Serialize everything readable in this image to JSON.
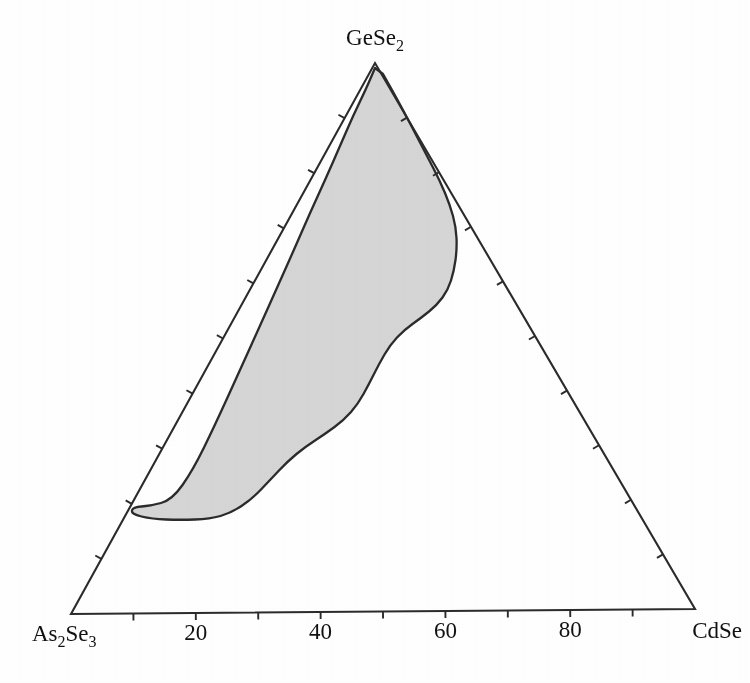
{
  "figure": {
    "type": "ternary-phase-diagram",
    "background_color": "#ffffff",
    "line_color": "#2b2b2b",
    "region_fill_color": "#d6d6d6"
  },
  "vertices": {
    "apex": {
      "label_main": "GeSe",
      "label_sub": "2",
      "x": 375,
      "y": 63
    },
    "left": {
      "label_main": "As",
      "label_sub_1": "2",
      "label_mid": "Se",
      "label_sub_2": "3",
      "x": 71,
      "y": 614
    },
    "right": {
      "label_main": "CdSe",
      "x": 695,
      "y": 609
    }
  },
  "bottom_axis": {
    "tick_labels": [
      "20",
      "40",
      "60",
      "80"
    ],
    "tick_label_values": [
      20,
      40,
      60,
      80
    ],
    "tick_interval": 10,
    "tick_count": 9
  },
  "chart_data": {
    "type": "ternary",
    "title": "",
    "subtitle": "",
    "xlabel": "",
    "ylabel": "",
    "components": [
      "GeSe2",
      "As2Se3",
      "CdSe"
    ],
    "vertex_labels": {
      "top": "GeSe2",
      "bottom_left": "As2Se3",
      "bottom_right": "CdSe"
    },
    "axis_tick_labels": [
      "20",
      "40",
      "60",
      "80"
    ],
    "axis_tick_interval": 10,
    "axis_range": [
      0,
      100
    ],
    "grid": false,
    "legend": null,
    "annotations": [],
    "series": [
      {
        "name": "glass-forming region",
        "fill": "#d6d6d6",
        "outline": "#2b2b2b",
        "closed": true,
        "pixel_polygon": [
          [
            375,
            68
          ],
          [
            366,
            89
          ],
          [
            353,
            116
          ],
          [
            340,
            146
          ],
          [
            326,
            178
          ],
          [
            310,
            213
          ],
          [
            293,
            252
          ],
          [
            276,
            290
          ],
          [
            259,
            328
          ],
          [
            240,
            370
          ],
          [
            215,
            425
          ],
          [
            193,
            470
          ],
          [
            172,
            500
          ],
          [
            150,
            506
          ],
          [
            133,
            507
          ],
          [
            131,
            514
          ],
          [
            152,
            519
          ],
          [
            180,
            520
          ],
          [
            210,
            519
          ],
          [
            231,
            513
          ],
          [
            252,
            499
          ],
          [
            270,
            480
          ],
          [
            288,
            461
          ],
          [
            305,
            447
          ],
          [
            325,
            434
          ],
          [
            344,
            420
          ],
          [
            358,
            404
          ],
          [
            369,
            384
          ],
          [
            379,
            364
          ],
          [
            390,
            345
          ],
          [
            404,
            330
          ],
          [
            421,
            318
          ],
          [
            437,
            305
          ],
          [
            448,
            290
          ],
          [
            454,
            271
          ],
          [
            457,
            249
          ],
          [
            456,
            227
          ],
          [
            450,
            205
          ],
          [
            440,
            181
          ],
          [
            427,
            156
          ],
          [
            412,
            127
          ],
          [
            396,
            97
          ],
          [
            383,
            74
          ]
        ],
        "pixel_polygon_note": "boundary of shaded glass-formation field in image pixel coordinates"
      }
    ]
  }
}
